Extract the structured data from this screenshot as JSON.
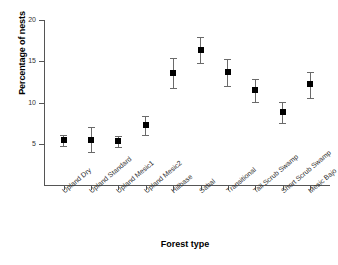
{
  "chart_data": {
    "type": "scatter",
    "title": "",
    "xlabel": "Forest type",
    "ylabel": "Percentage of nests",
    "ylim": [
      0,
      20
    ],
    "yticks": [
      5,
      10,
      15,
      20
    ],
    "ytick_labels": [
      "5",
      "10",
      "15",
      "20"
    ],
    "grid": false,
    "legend": null,
    "error_bar_style": "capped-vertical",
    "marker_style": "filled-square",
    "marker_color": "#000000",
    "errorbar_color": "#6a6a6a",
    "categories": [
      "Upland Dry",
      "Upland Standard",
      "Upland Mesic1",
      "Upland Mesic2",
      "Hillbase",
      "Sabal",
      "Transitional",
      "Tall Scrub Swamp",
      "Short Scrub Swamp",
      "Mesic Bajo"
    ],
    "values": [
      5.4,
      5.5,
      5.3,
      7.3,
      13.6,
      16.4,
      13.7,
      11.5,
      8.8,
      12.2
    ],
    "err_low": [
      4.7,
      4.0,
      4.6,
      6.1,
      11.7,
      14.8,
      12.0,
      10.1,
      7.5,
      10.6
    ],
    "err_high": [
      6.1,
      7.0,
      6.0,
      8.4,
      15.4,
      17.9,
      15.3,
      12.8,
      10.1,
      13.7
    ]
  }
}
